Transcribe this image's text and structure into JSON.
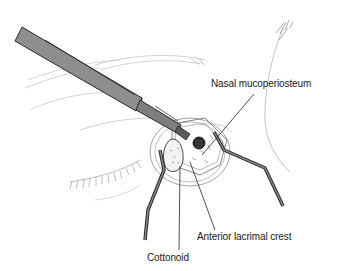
{
  "figure": {
    "type": "surgical-illustration",
    "colors": {
      "instrument_fill": "#8a8a8a",
      "instrument_dark": "#3a3a3a",
      "line": "#2a2a2a",
      "sketch": "#9a9a9a",
      "background": "#ffffff"
    }
  },
  "labels": {
    "nasal_mucoperiosteum": "Nasal mucoperiosteum",
    "anterior_lacrimal_crest": "Anterior lacrimal crest",
    "cottonoid": "Cottonoid"
  }
}
